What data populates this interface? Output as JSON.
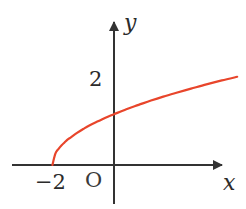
{
  "figure": {
    "title": "",
    "background_color": "#ffffff",
    "curve_color": "#e8452b",
    "axis_color": "#333333",
    "text_color": "#2b2b2b"
  },
  "labels": {
    "y_axis": "y",
    "x_axis": "x",
    "origin": "O",
    "y_tick_2": "2",
    "x_tick_neg2": "−2"
  },
  "chart_data": {
    "type": "line",
    "title": "",
    "xlabel": "x",
    "ylabel": "y",
    "legend": [],
    "grid": false,
    "xlim": [
      -2.9,
      4.1
    ],
    "ylim": [
      -0.6,
      3.5
    ],
    "xticks": [
      -2,
      0
    ],
    "xticklabels": [
      "−2",
      "O"
    ],
    "yticks": [
      2
    ],
    "yticklabels": [
      "2"
    ],
    "annotations": [],
    "series": [
      {
        "name": "y = sqrt(x + 2)",
        "color": "#e8452b",
        "x": [
          -2.0,
          -1.9,
          -1.8,
          -1.7,
          -1.6,
          -1.5,
          -1.4,
          -1.2,
          -1.0,
          -0.8,
          -0.5,
          -0.2,
          0.0,
          0.4,
          0.8,
          1.2,
          1.6,
          2.0,
          2.5,
          3.0,
          3.5,
          4.0
        ],
        "y": [
          0.0,
          0.32,
          0.45,
          0.55,
          0.63,
          0.71,
          0.77,
          0.89,
          1.0,
          1.1,
          1.22,
          1.34,
          1.41,
          1.55,
          1.67,
          1.79,
          1.9,
          2.0,
          2.12,
          2.24,
          2.35,
          2.45
        ]
      }
    ]
  }
}
